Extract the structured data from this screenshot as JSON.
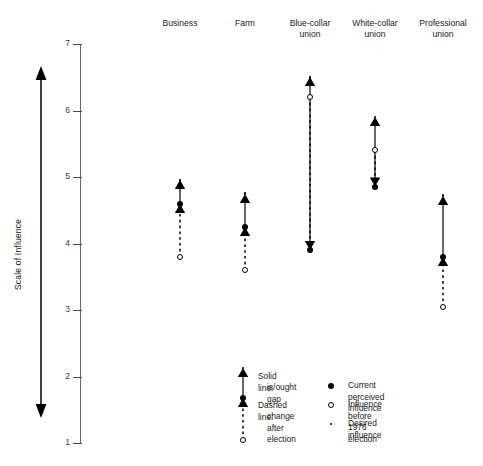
{
  "figure": {
    "title_fragment": "",
    "y_axis_label": "Scale of Influence"
  },
  "axis": {
    "ticks": [
      "7",
      "6",
      "5",
      "4",
      "3",
      "2",
      "1"
    ],
    "min": 1,
    "max": 7,
    "double_arrow_name": "scale-direction-arrow"
  },
  "columns": [
    {
      "label": "Business"
    },
    {
      "label": "Farm"
    },
    {
      "label": "Blue-collar\nunion"
    },
    {
      "label": "White-collar\nunion"
    },
    {
      "label": "Professional\nunion"
    }
  ],
  "line_legend": [
    {
      "title": "Solid line:",
      "detail": "is/ought gap"
    },
    {
      "title": "Dashed line:",
      "detail": "change after\nelection"
    }
  ],
  "marker_legend": [
    {
      "marker": "filled-dot",
      "label": "Current perceived influence"
    },
    {
      "marker": "open-circle",
      "label": "Influence before 1976 election"
    },
    {
      "marker": "small-dot",
      "label": "Desired influence"
    }
  ],
  "chart_data": {
    "type": "scatter",
    "xlabel": "",
    "ylabel": "Scale of Influence",
    "ylim": [
      1,
      7
    ],
    "grid": false,
    "legend_position": "bottom-right",
    "categories": [
      "Business",
      "Farm",
      "Blue-collar union",
      "White-collar union",
      "Professional union"
    ],
    "series": [
      {
        "name": "Current perceived influence",
        "marker": "filled-dot",
        "values": [
          4.6,
          4.25,
          3.9,
          4.85,
          3.8
        ]
      },
      {
        "name": "Influence before 1976 election",
        "marker": "open-circle",
        "values": [
          3.8,
          3.6,
          6.2,
          5.4,
          3.05
        ]
      },
      {
        "name": "Desired influence",
        "marker": "small-dot",
        "values": [
          4.95,
          4.75,
          6.5,
          5.9,
          4.72
        ]
      }
    ],
    "annotations": [
      "Solid line: is/ought gap",
      "Dashed line: change after election"
    ]
  }
}
